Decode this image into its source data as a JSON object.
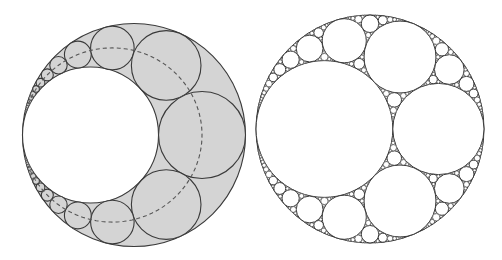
{
  "figure": {
    "width": 502,
    "height": 260,
    "background": "#ffffff",
    "stroke_color": "#3a3a3a",
    "fill_shaded": "#d4d4d4",
    "fill_white": "#ffffff",
    "dash_color": "#555555"
  },
  "panels": [
    {
      "id": "pappus-chain",
      "description": "Pappus chain of circles inscribed in the crescent between two internally tangent circles; shaded region with dashed curve through chain centers",
      "outer_circle": {
        "cx": 134,
        "cy": 135,
        "r": 111.5
      },
      "inner_circle_diameter_ratio": 0.61,
      "chain_visible_each_side": 14,
      "shaded": true,
      "dashed_center_curve": true
    },
    {
      "id": "apollonian-gasket",
      "description": "Same configuration filled recursively with mutually tangent circles (Apollonian gasket)",
      "outer_circle": {
        "cx": 370,
        "cy": 129,
        "r": 114
      },
      "inner_circle_diameter_ratio": 0.6,
      "chain_visible_each_side": 10,
      "min_radius": 0.6,
      "shaded": false,
      "dashed_center_curve": false
    }
  ]
}
